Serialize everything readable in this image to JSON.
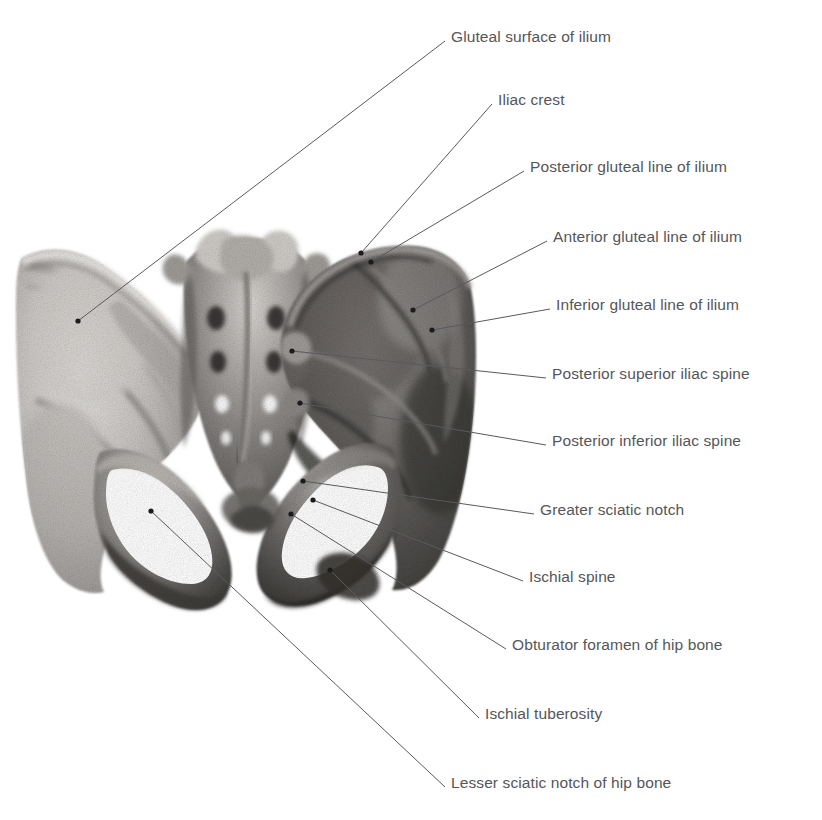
{
  "figure": {
    "background_color": "#ffffff",
    "label_color": "#55565a",
    "leader_line_color": "#5a5a5e",
    "bone_tone_light": "#d8d6d3",
    "bone_tone_mid": "#9b9896",
    "bone_tone_dark": "#4a4846"
  },
  "labels": [
    {
      "id": "gluteal-surface-of-ilium",
      "text": "Gluteal surface of ilium",
      "x": 451,
      "y": 29,
      "dot_x": 78,
      "dot_y": 321
    },
    {
      "id": "iliac-crest",
      "text": "Iliac crest",
      "x": 498,
      "y": 92,
      "dot_x": 361,
      "dot_y": 253
    },
    {
      "id": "posterior-gluteal-line-of-ilium",
      "text": "Posterior gluteal line of ilium",
      "x": 530,
      "y": 159,
      "dot_x": 371,
      "dot_y": 262
    },
    {
      "id": "anterior-gluteal-line-of-ilium",
      "text": "Anterior gluteal line of ilium",
      "x": 553,
      "y": 229,
      "dot_x": 413,
      "dot_y": 310
    },
    {
      "id": "inferior-gluteal-line-of-ilium",
      "text": "Inferior gluteal line of ilium",
      "x": 556,
      "y": 297,
      "dot_x": 432,
      "dot_y": 330
    },
    {
      "id": "posterior-superior-iliac-spine",
      "text": "Posterior superior iliac spine",
      "x": 552,
      "y": 366,
      "dot_x": 292,
      "dot_y": 351
    },
    {
      "id": "posterior-inferior-iliac-spine",
      "text": "Posterior inferior iliac spine",
      "x": 552,
      "y": 433,
      "dot_x": 300,
      "dot_y": 403
    },
    {
      "id": "greater-sciatic-notch",
      "text": "Greater sciatic notch",
      "x": 540,
      "y": 502,
      "dot_x": 303,
      "dot_y": 481
    },
    {
      "id": "ischial-spine",
      "text": "Ischial spine",
      "x": 529,
      "y": 569,
      "dot_x": 313,
      "dot_y": 500
    },
    {
      "id": "obturator-foramen-of-hip-bone",
      "text": "Obturator foramen of hip bone",
      "x": 512,
      "y": 637,
      "dot_x": 291,
      "dot_y": 514
    },
    {
      "id": "ischial-tuberosity",
      "text": "Ischial tuberosity",
      "x": 485,
      "y": 706,
      "dot_x": 330,
      "dot_y": 570
    },
    {
      "id": "lesser-sciatic-notch-of-hip-bone",
      "text": "Lesser sciatic notch of hip bone",
      "x": 451,
      "y": 775,
      "dot_x": 151,
      "dot_y": 511
    }
  ]
}
